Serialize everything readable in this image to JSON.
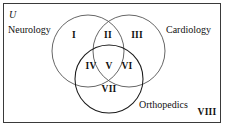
{
  "diagram": {
    "type": "venn",
    "universe_symbol": "U",
    "sets": [
      {
        "id": "neurology",
        "label": "Neurology",
        "position": "left"
      },
      {
        "id": "cardiology",
        "label": "Cardiology",
        "position": "right"
      },
      {
        "id": "orthopedics",
        "label": "Orthopedics",
        "position": "bottom"
      }
    ],
    "regions": [
      {
        "id": "i",
        "label": "I",
        "members": [
          "neurology"
        ]
      },
      {
        "id": "ii",
        "label": "II",
        "members": [
          "neurology",
          "cardiology"
        ]
      },
      {
        "id": "iii",
        "label": "III",
        "members": [
          "cardiology"
        ]
      },
      {
        "id": "iv",
        "label": "IV",
        "members": [
          "neurology",
          "orthopedics"
        ]
      },
      {
        "id": "v",
        "label": "V",
        "members": [
          "neurology",
          "cardiology",
          "orthopedics"
        ]
      },
      {
        "id": "vi",
        "label": "VI",
        "members": [
          "cardiology",
          "orthopedics"
        ]
      },
      {
        "id": "vii",
        "label": "VII",
        "members": [
          "orthopedics"
        ]
      },
      {
        "id": "viii",
        "label": "VIII",
        "members": []
      }
    ],
    "colors": {
      "frame_stroke": "#3a3a3a",
      "circle_stroke": "#555555",
      "orthopedics_stroke": "#1a1a1a",
      "text": "#111111",
      "background": "#ffffff"
    }
  }
}
